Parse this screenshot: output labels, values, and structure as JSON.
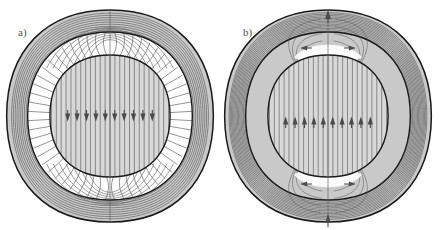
{
  "figure": {
    "name": "magnetic-field-line-comparison",
    "width": 440,
    "height": 230,
    "background": "#ffffff",
    "panels": [
      {
        "id": "a",
        "label": "a)",
        "label_x": 18,
        "label_y": 36,
        "center_x": 110,
        "center_y": 116,
        "outer_radius": 106,
        "outer_inner_radius": 84,
        "gap_outer_radius": 84,
        "gap_inner_radius": 61,
        "core_radius": 61,
        "description": "Outer annulus filled with nested field lines; empty white annular gap where field lines fan radially; shaded core disk with vertical field lines and downward arrowheads",
        "core_arrow_direction": "down",
        "core_arrow_count": 10,
        "core_arrow_y": 118,
        "core_arrow_span": 94,
        "vertical_axis_line": true,
        "annulus_line_count": 9,
        "gap_spoke_count": 56,
        "core_line_count": 25,
        "pole_arrows": [],
        "equator_arrows": []
      },
      {
        "id": "b",
        "label": "b)",
        "label_x": 243,
        "label_y": 36,
        "center_x": 328,
        "center_y": 116,
        "outer_radius": 106,
        "outer_inner_radius": 84,
        "gap_outer_radius": 84,
        "gap_inner_radius": 61,
        "core_radius": 61,
        "description": "Outer annulus and mid annulus both densely filled with nested field lines converging at the poles; shaded core disk with vertical field lines and upward arrowheads; poloidal arrows at top and bottom poles plus horizontal arrow pairs",
        "core_arrow_direction": "up",
        "core_arrow_count": 10,
        "core_arrow_y": 120,
        "core_arrow_span": 94,
        "vertical_axis_line": true,
        "annulus_line_count": 14,
        "gap_line_count": 17,
        "core_line_count": 25,
        "pole_arrows": [
          {
            "name": "top-pole-arrow",
            "direction": "up",
            "x": 328,
            "y": 14
          },
          {
            "name": "bottom-pole-arrow",
            "direction": "up",
            "x": 328,
            "y": 218
          }
        ],
        "equator_arrows": [
          {
            "name": "top-left-outward-arrow",
            "direction": "left",
            "x": 312,
            "y": 48
          },
          {
            "name": "top-right-outward-arrow",
            "direction": "right",
            "x": 344,
            "y": 48
          },
          {
            "name": "bottom-left-inward-arrow",
            "direction": "left",
            "x": 312,
            "y": 184
          },
          {
            "name": "bottom-right-inward-arrow",
            "direction": "right",
            "x": 344,
            "y": 184
          }
        ]
      }
    ],
    "colors": {
      "background": "#ffffff",
      "outline": "#1a1a1a",
      "field_line": "#666666",
      "field_line_dark": "#4a4a4a",
      "core_fill": "#d8d8d8",
      "annulus_fill": "#c9c9c9",
      "gap_fill": "#ffffff",
      "arrow": "#4a4a4a",
      "label_text": "#555555"
    }
  }
}
